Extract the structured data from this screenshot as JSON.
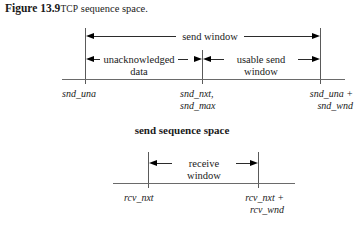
{
  "caption": {
    "figure_number": "Figure 13.9",
    "protocol": "TCP",
    "rest": "sequence space."
  },
  "send_diagram": {
    "window_label": "send window",
    "left_segment_label_line1": "unacknowledged",
    "left_segment_label_line2": "data",
    "right_segment_label_line1": "usable send",
    "right_segment_label_line2": "window",
    "marker_left": "snd_una",
    "marker_middle_line1": "snd_nxt,",
    "marker_middle_line2": "snd_max",
    "marker_right_line1": "snd_una +",
    "marker_right_line2": "snd_wnd",
    "title": "send sequence space"
  },
  "receive_diagram": {
    "window_label_line1": "receive",
    "window_label_line2": "window",
    "marker_left": "rcv_nxt",
    "marker_right_line1": "rcv_nxt +",
    "marker_right_line2": "rcv_wnd"
  },
  "colors": {
    "text": "#1a1a1a",
    "rule": "#2b2b2b",
    "baseline": "#6a6a6a",
    "background": "#ffffff"
  }
}
